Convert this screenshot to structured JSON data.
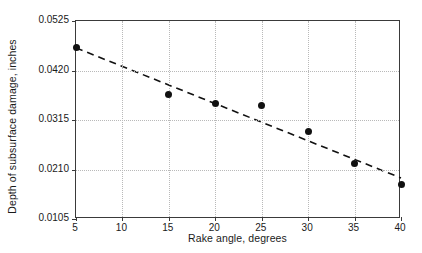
{
  "chart_data": {
    "type": "scatter",
    "title": "",
    "xlabel": "Rake angle, degrees",
    "ylabel": "Depth of subsurface damage, inches",
    "x": [
      5,
      15,
      20,
      25,
      30,
      35,
      40
    ],
    "values": [
      0.0468,
      0.037,
      0.0349,
      0.0345,
      0.029,
      0.0222,
      0.0179
    ],
    "series": [
      {
        "name": "Measured depth of subsurface damage",
        "marker": "filled-circle",
        "color": "#111111",
        "x": [
          5,
          15,
          20,
          25,
          30,
          35,
          40
        ],
        "values": [
          0.0468,
          0.037,
          0.0349,
          0.0345,
          0.029,
          0.0222,
          0.0179
        ]
      },
      {
        "name": "Fitted trend line",
        "style": "dashed",
        "color": "#111111",
        "x": [
          5,
          40
        ],
        "values": [
          0.0468,
          0.0192
        ]
      }
    ],
    "xlim": [
      5,
      40
    ],
    "ylim": [
      0.0105,
      0.0525
    ],
    "xticks": [
      5,
      10,
      15,
      20,
      25,
      30,
      35,
      40
    ],
    "xtick_labels": [
      "5",
      "10",
      "15",
      "20",
      "25",
      "30",
      "35",
      "40"
    ],
    "yticks": [
      0.0105,
      0.021,
      0.0315,
      0.042,
      0.0525
    ],
    "ytick_labels": [
      "0.0105",
      "0.0210",
      "0.0315",
      "0.0420",
      "0.0525"
    ],
    "grid": true,
    "grid_style": "dotted",
    "legend": "none",
    "background_color": "#ffffff",
    "axis_color": "#3a3a3a",
    "grid_color": "#b9b9b9"
  }
}
